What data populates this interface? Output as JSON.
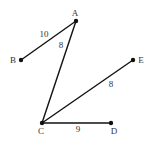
{
  "diagram": {
    "points": [
      {
        "id": "A",
        "label": "A",
        "x": 76,
        "y": 21,
        "lx": 75,
        "ly": 16
      },
      {
        "id": "B",
        "label": "B",
        "x": 21,
        "y": 60,
        "lx": 13,
        "ly": 63
      },
      {
        "id": "C",
        "label": "C",
        "x": 42,
        "y": 123,
        "lx": 41,
        "ly": 134
      },
      {
        "id": "D",
        "label": "D",
        "x": 111,
        "y": 123,
        "lx": 114,
        "ly": 134
      },
      {
        "id": "E",
        "label": "E",
        "x": 133,
        "y": 60,
        "lx": 141,
        "ly": 63
      }
    ],
    "segments": [
      {
        "from": "B",
        "to": "A",
        "length_label": "10",
        "lx": 44,
        "ly": 37
      },
      {
        "from": "A",
        "to": "C",
        "length_label": "8",
        "lx": 61,
        "ly": 48
      },
      {
        "from": "C",
        "to": "E",
        "length_label": "8",
        "lx": 111,
        "ly": 87
      },
      {
        "from": "C",
        "to": "D",
        "length_label": "9",
        "lx": 78,
        "ly": 132
      }
    ],
    "colors": {
      "line": "#111111",
      "text": "#333333",
      "background": "#ffffff"
    }
  }
}
